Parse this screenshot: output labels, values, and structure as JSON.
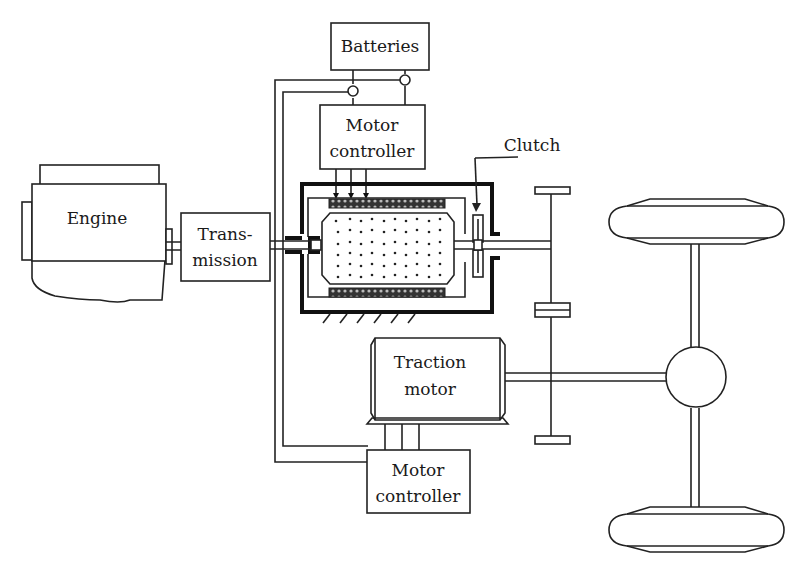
{
  "diagram": {
    "title": "",
    "components": {
      "batteries": "Batteries",
      "motor_controller_top_line1": "Motor",
      "motor_controller_top_line2": "controller",
      "clutch": "Clutch",
      "engine": "Engine",
      "transmission_line1": "Trans-",
      "transmission_line2": "mission",
      "traction_motor_line1": "Traction",
      "traction_motor_line2": "motor",
      "motor_controller_bottom_line1": "Motor",
      "motor_controller_bottom_line2": "controller"
    },
    "elements": [
      "Engine",
      "Transmission",
      "Batteries",
      "Motor controller (top)",
      "Electric machine (stator/rotor)",
      "Clutch",
      "Gear shaft",
      "Traction motor",
      "Motor controller (bottom)",
      "Differential",
      "Wheels (2)"
    ],
    "colors": {
      "line": "#222222",
      "background": "#ffffff"
    }
  }
}
